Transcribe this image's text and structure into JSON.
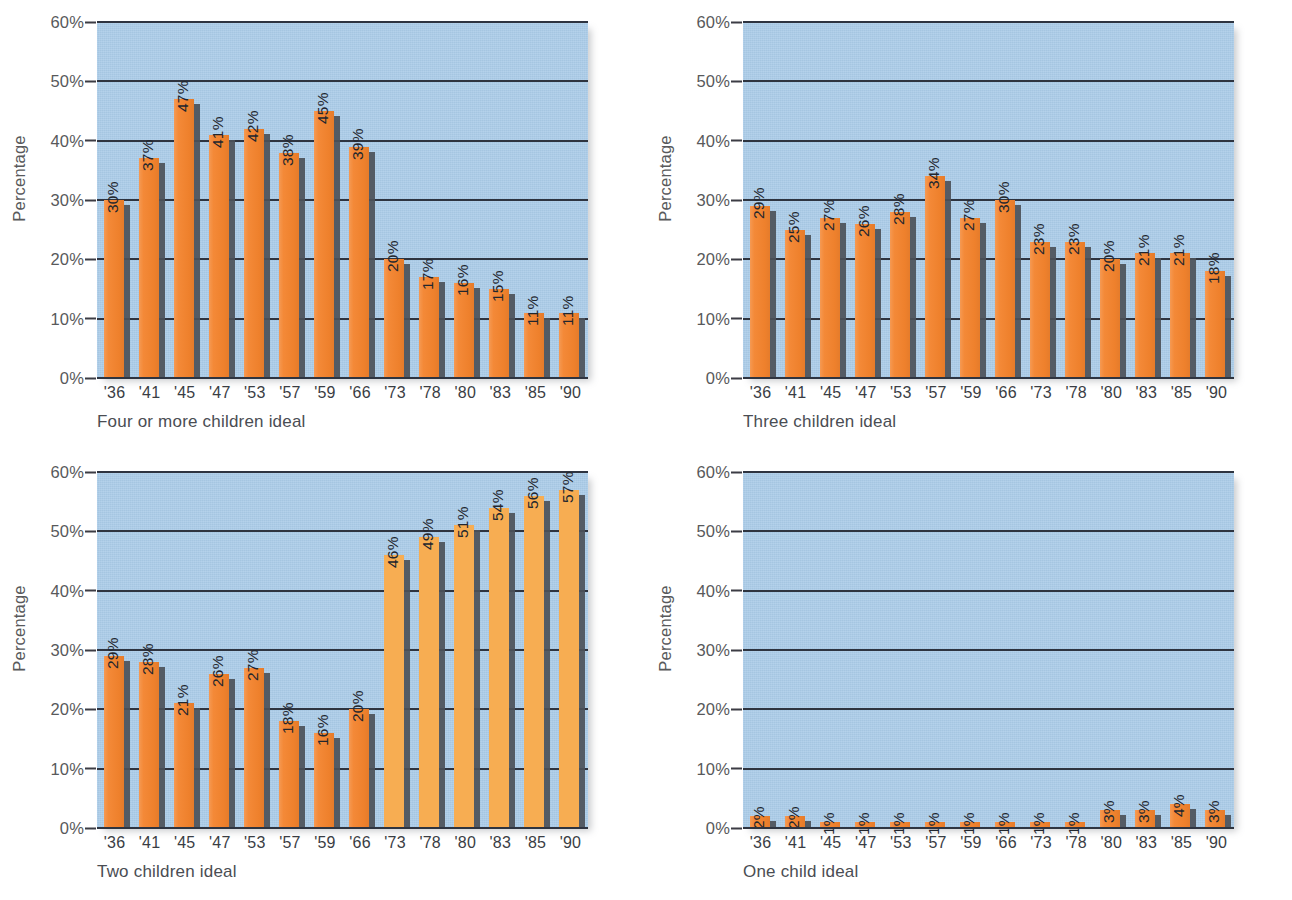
{
  "figure": {
    "axis_label": "Percentage",
    "y_ticks": [
      "0%",
      "10%",
      "20%",
      "30%",
      "40%",
      "50%",
      "60%"
    ],
    "categories": [
      "'36",
      "'41",
      "'45",
      "'47",
      "'53",
      "'57",
      "'59",
      "'66",
      "'73",
      "'78",
      "'80",
      "'83",
      "'85",
      "'90"
    ],
    "colors": {
      "plot_background": "#aacbe8",
      "bar_primary": "#f3832d",
      "bar_light": "#f7ad52",
      "bar_shadow": "#4c5159",
      "gridline": "#2e3440",
      "text": "#58595b"
    }
  },
  "chart_data": [
    {
      "type": "bar",
      "title": "Four or more children ideal",
      "xlabel": "",
      "ylabel": "Percentage",
      "ylim": [
        0,
        60
      ],
      "yticks": [
        0,
        10,
        20,
        30,
        40,
        50,
        60
      ],
      "grid": true,
      "legend": "none",
      "categories": [
        "'36",
        "'41",
        "'45",
        "'47",
        "'53",
        "'57",
        "'59",
        "'66",
        "'73",
        "'78",
        "'80",
        "'83",
        "'85",
        "'90"
      ],
      "values": [
        30,
        37,
        47,
        41,
        42,
        38,
        45,
        39,
        20,
        17,
        16,
        15,
        11,
        11
      ],
      "labels": [
        "30%",
        "37%",
        "47%",
        "41%",
        "42%",
        "38%",
        "45%",
        "39%",
        "20%",
        "17%",
        "16%",
        "15%",
        "11%",
        "11%"
      ],
      "bar_shades": [
        "dark",
        "dark",
        "dark",
        "dark",
        "dark",
        "dark",
        "dark",
        "dark",
        "dark",
        "dark",
        "dark",
        "dark",
        "dark",
        "dark"
      ]
    },
    {
      "type": "bar",
      "title": "Three children ideal",
      "xlabel": "",
      "ylabel": "Percentage",
      "ylim": [
        0,
        60
      ],
      "yticks": [
        0,
        10,
        20,
        30,
        40,
        50,
        60
      ],
      "grid": true,
      "legend": "none",
      "categories": [
        "'36",
        "'41",
        "'45",
        "'47",
        "'53",
        "'57",
        "'59",
        "'66",
        "'73",
        "'78",
        "'80",
        "'83",
        "'85",
        "'90"
      ],
      "values": [
        29,
        25,
        27,
        26,
        28,
        34,
        27,
        30,
        23,
        23,
        20,
        21,
        21,
        18
      ],
      "labels": [
        "29%",
        "25%",
        "27%",
        "26%",
        "28%",
        "34%",
        "27%",
        "30%",
        "23%",
        "23%",
        "20%",
        "21%",
        "21%",
        "18%"
      ],
      "bar_shades": [
        "dark",
        "dark",
        "dark",
        "dark",
        "dark",
        "dark",
        "dark",
        "dark",
        "dark",
        "dark",
        "dark",
        "dark",
        "dark",
        "dark"
      ]
    },
    {
      "type": "bar",
      "title": "Two children ideal",
      "xlabel": "",
      "ylabel": "Percentage",
      "ylim": [
        0,
        60
      ],
      "yticks": [
        0,
        10,
        20,
        30,
        40,
        50,
        60
      ],
      "grid": true,
      "legend": "none",
      "categories": [
        "'36",
        "'41",
        "'45",
        "'47",
        "'53",
        "'57",
        "'59",
        "'66",
        "'73",
        "'78",
        "'80",
        "'83",
        "'85",
        "'90"
      ],
      "values": [
        29,
        28,
        21,
        26,
        27,
        18,
        16,
        20,
        46,
        49,
        51,
        54,
        56,
        57
      ],
      "labels": [
        "29%",
        "28%",
        "21%",
        "26%",
        "27%",
        "18%",
        "16%",
        "20%",
        "46%",
        "49%",
        "51%",
        "54%",
        "56%",
        "57%"
      ],
      "bar_shades": [
        "dark",
        "dark",
        "dark",
        "dark",
        "dark",
        "dark",
        "dark",
        "dark",
        "light",
        "light",
        "light",
        "light",
        "light",
        "light"
      ]
    },
    {
      "type": "bar",
      "title": "One child ideal",
      "xlabel": "",
      "ylabel": "Percentage",
      "ylim": [
        0,
        60
      ],
      "yticks": [
        0,
        10,
        20,
        30,
        40,
        50,
        60
      ],
      "grid": true,
      "legend": "none",
      "categories": [
        "'36",
        "'41",
        "'45",
        "'47",
        "'53",
        "'57",
        "'59",
        "'66",
        "'73",
        "'78",
        "'80",
        "'83",
        "'85",
        "'90"
      ],
      "values": [
        2,
        2,
        1,
        1,
        1,
        1,
        1,
        1,
        1,
        1,
        3,
        3,
        4,
        3
      ],
      "labels": [
        "2%",
        "2%",
        "1%",
        "1%",
        "1%",
        "1%",
        "1%",
        "1%",
        "1%",
        "1%",
        "3%",
        "3%",
        "4%",
        "3%"
      ],
      "bar_shades": [
        "dark",
        "dark",
        "dark",
        "dark",
        "dark",
        "dark",
        "dark",
        "dark",
        "dark",
        "dark",
        "dark",
        "dark",
        "dark",
        "dark"
      ]
    }
  ]
}
